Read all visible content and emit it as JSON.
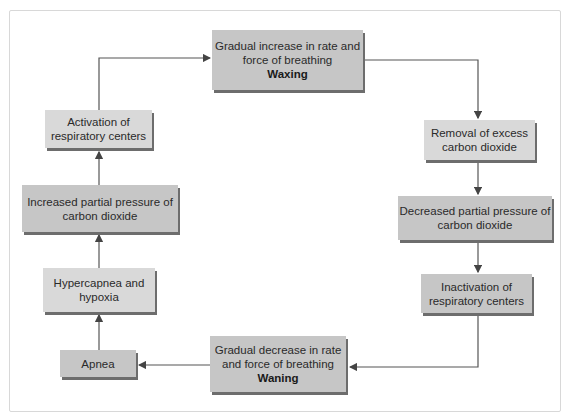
{
  "diagram": {
    "title": "",
    "type": "cycle",
    "nodes": [
      {
        "id": "waxing",
        "line1": "Gradual increase in rate and",
        "line2": "force of breathing",
        "label_bold": "Waxing"
      },
      {
        "id": "removal",
        "line1": "Removal of excess",
        "line2": "carbon dioxide"
      },
      {
        "id": "decreased",
        "line1": "Decreased partial pressure of",
        "line2": "carbon dioxide"
      },
      {
        "id": "inactivation",
        "line1": "Inactivation of",
        "line2": "respiratory centers"
      },
      {
        "id": "waning",
        "line1": "Gradual decrease in rate",
        "line2": "and force of breathing",
        "label_bold": "Waning"
      },
      {
        "id": "apnea",
        "line1": "Apnea"
      },
      {
        "id": "hypercapnea",
        "line1": "Hypercapnea and",
        "line2": "hypoxia"
      },
      {
        "id": "increased",
        "line1": "Increased partial pressure of",
        "line2": "carbon dioxide"
      },
      {
        "id": "activation",
        "line1": "Activation of",
        "line2": "respiratory centers"
      }
    ],
    "edges": [
      [
        "waxing",
        "removal"
      ],
      [
        "removal",
        "decreased"
      ],
      [
        "decreased",
        "inactivation"
      ],
      [
        "inactivation",
        "waning"
      ],
      [
        "waning",
        "apnea"
      ],
      [
        "apnea",
        "hypercapnea"
      ],
      [
        "hypercapnea",
        "increased"
      ],
      [
        "increased",
        "activation"
      ],
      [
        "activation",
        "waxing"
      ]
    ],
    "colors": {
      "box_light": "#d9d9d9",
      "box_dark": "#c6c6c6",
      "shadow": "#6d6d6d",
      "arrow": "#444444"
    }
  }
}
